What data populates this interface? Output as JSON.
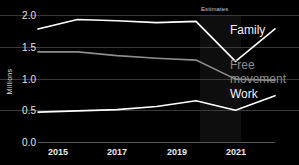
{
  "chart_data": {
    "type": "line",
    "title": "",
    "subtitle": "",
    "xlabel": "",
    "ylabel": "Millions",
    "x": [
      2015,
      2016,
      2017,
      2018,
      2019,
      2020,
      2021
    ],
    "xtick_labels": [
      "2015",
      "2017",
      "2019",
      "2021"
    ],
    "xtick_values": [
      2015,
      2017,
      2019,
      2021
    ],
    "ytick_labels": [
      "0.0",
      "0.5",
      "1.0",
      "1.5",
      "2.0"
    ],
    "ytick_values": [
      0.0,
      0.5,
      1.0,
      1.5,
      2.0
    ],
    "ylim": [
      0.0,
      2.0
    ],
    "xlim": [
      2015,
      2021
    ],
    "grid": true,
    "legend_position": "right-inline",
    "annotations": [
      {
        "text": "Estimates",
        "x_start": 2020,
        "x_end": 2021,
        "type": "shaded-band-label"
      }
    ],
    "series": [
      {
        "name": "Family",
        "color": "#ffffff",
        "label_color": "#f2f2f2",
        "values": [
          1.78,
          1.93,
          1.91,
          1.88,
          1.9,
          1.27,
          1.78
        ]
      },
      {
        "name": "Free movement",
        "color": "#8c8c8c",
        "label_color": "#8c8c8c",
        "values": [
          1.42,
          1.42,
          1.36,
          1.32,
          1.29,
          0.99,
          0.97
        ]
      },
      {
        "name": "Work",
        "color": "#ffffff",
        "label_color": "#f4f4f4",
        "values": [
          0.47,
          0.49,
          0.51,
          0.56,
          0.65,
          0.5,
          0.73
        ]
      }
    ]
  },
  "axis": {
    "y_label": "Millions",
    "y_ticks": [
      "2.0",
      "1.5",
      "1.0",
      "0.5",
      "0.0"
    ],
    "x_ticks": [
      "2015",
      "2017",
      "2019",
      "2021"
    ]
  },
  "labels": {
    "estimates": "Estimates",
    "family": "Family",
    "free_movement_line1": "Free",
    "free_movement_line2": "movement",
    "work": "Work"
  },
  "colors": {
    "background": "#000000",
    "grid": "#3a3a3a",
    "primary_line": "#ffffff",
    "secondary_line": "#8c8c8c",
    "estimates_band": "#0e0e0e",
    "text": "#e8e8e8"
  }
}
